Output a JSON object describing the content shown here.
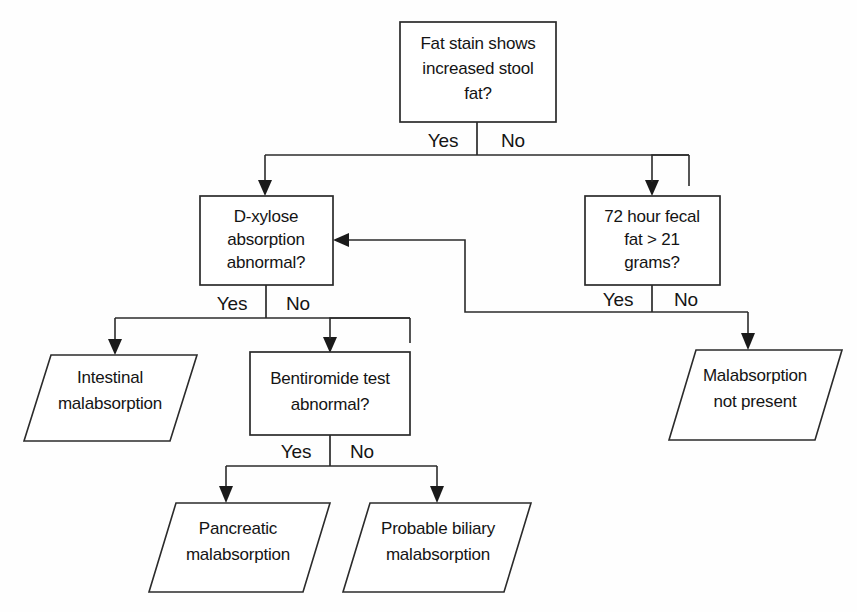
{
  "diagram": {
    "type": "flowchart",
    "colors": {
      "background": "#fefefe",
      "stroke": "#2b2b2b",
      "text": "#141414",
      "shape_fill": "#ffffff"
    },
    "nodes": [
      {
        "id": "fat-stain",
        "shape": "rectangle",
        "role": "decision",
        "lines": [
          "Fat stain shows",
          "increased stool",
          "fat?"
        ]
      },
      {
        "id": "d-xylose",
        "shape": "rectangle",
        "role": "decision",
        "lines": [
          "D-xylose",
          "absorption",
          "abnormal?"
        ]
      },
      {
        "id": "fecal-fat",
        "shape": "rectangle",
        "role": "decision",
        "lines": [
          "72 hour fecal",
          "fat > 21",
          "grams?"
        ]
      },
      {
        "id": "bentiromide",
        "shape": "rectangle",
        "role": "decision",
        "lines": [
          "Bentiromide test",
          "abnormal?"
        ]
      },
      {
        "id": "intestinal",
        "shape": "parallelogram",
        "role": "outcome",
        "lines": [
          "Intestinal",
          "malabsorption"
        ]
      },
      {
        "id": "no-malabsorption",
        "shape": "parallelogram",
        "role": "outcome",
        "lines": [
          "Malabsorption",
          "not present"
        ]
      },
      {
        "id": "pancreatic",
        "shape": "parallelogram",
        "role": "outcome",
        "lines": [
          "Pancreatic",
          "malabsorption"
        ]
      },
      {
        "id": "biliary",
        "shape": "parallelogram",
        "role": "outcome",
        "lines": [
          "Probable biliary",
          "malabsorption"
        ]
      }
    ],
    "branch_labels": {
      "yes": "Yes",
      "no": "No"
    },
    "edges": [
      {
        "from": "fat-stain",
        "to": "d-xylose",
        "label": "Yes"
      },
      {
        "from": "fat-stain",
        "to": "fecal-fat",
        "label": "No"
      },
      {
        "from": "d-xylose",
        "to": "intestinal",
        "label": "Yes"
      },
      {
        "from": "d-xylose",
        "to": "bentiromide",
        "label": "No"
      },
      {
        "from": "fecal-fat",
        "to": "d-xylose",
        "label": "Yes"
      },
      {
        "from": "fecal-fat",
        "to": "no-malabsorption",
        "label": "No"
      },
      {
        "from": "bentiromide",
        "to": "pancreatic",
        "label": "Yes"
      },
      {
        "from": "bentiromide",
        "to": "biliary",
        "label": "No"
      }
    ]
  }
}
